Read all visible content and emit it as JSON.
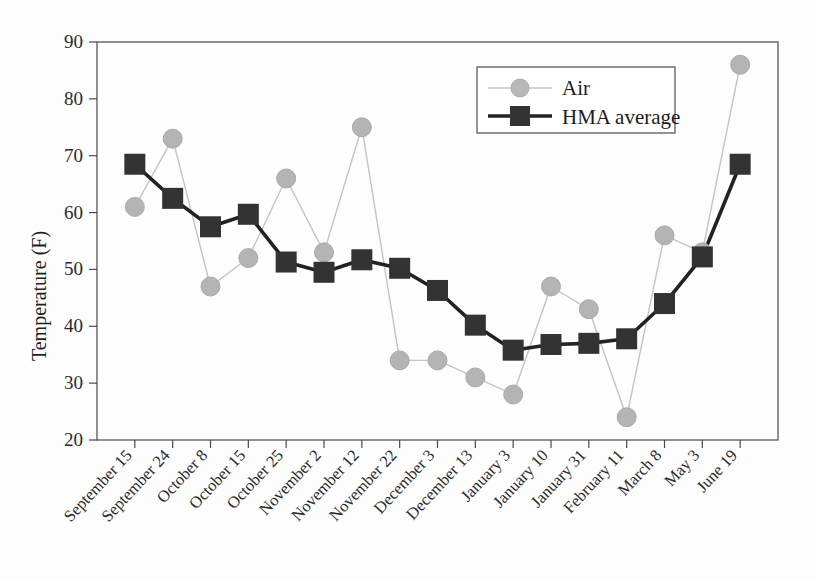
{
  "chart_data": {
    "type": "line",
    "title": "",
    "xlabel": "",
    "ylabel": "Temperature (F)",
    "ylim": [
      20,
      90
    ],
    "ytick_step": 10,
    "yticks": [
      20,
      30,
      40,
      50,
      60,
      70,
      80,
      90
    ],
    "grid": false,
    "legend_position": "top-center-right",
    "categories": [
      "September 15",
      "September 24",
      "October 8",
      "October 15",
      "October 25",
      "November 2",
      "November 12",
      "November 22",
      "December 3",
      "December 13",
      "January 3",
      "January 10",
      "January 31",
      "February 11",
      "March 8",
      "May 3",
      "June 19"
    ],
    "series": [
      {
        "name": "Air",
        "marker": "circle",
        "color": "#b4b4b4",
        "line_color": "#c4c4c4",
        "values": [
          61,
          73,
          47,
          52,
          66,
          53,
          75,
          34,
          34,
          31,
          28,
          47,
          43,
          24,
          56,
          53,
          86
        ]
      },
      {
        "name": "HMA average",
        "marker": "square",
        "color": "#333333",
        "line_color": "#222222",
        "values": [
          68.5,
          62.5,
          57.5,
          59.7,
          51.3,
          49.5,
          51.7,
          50.2,
          46.3,
          40.2,
          35.8,
          36.8,
          37,
          37.8,
          44,
          52.2,
          68.5
        ]
      }
    ]
  },
  "legend": {
    "entries": [
      {
        "label": "Air"
      },
      {
        "label": "HMA average"
      }
    ]
  }
}
